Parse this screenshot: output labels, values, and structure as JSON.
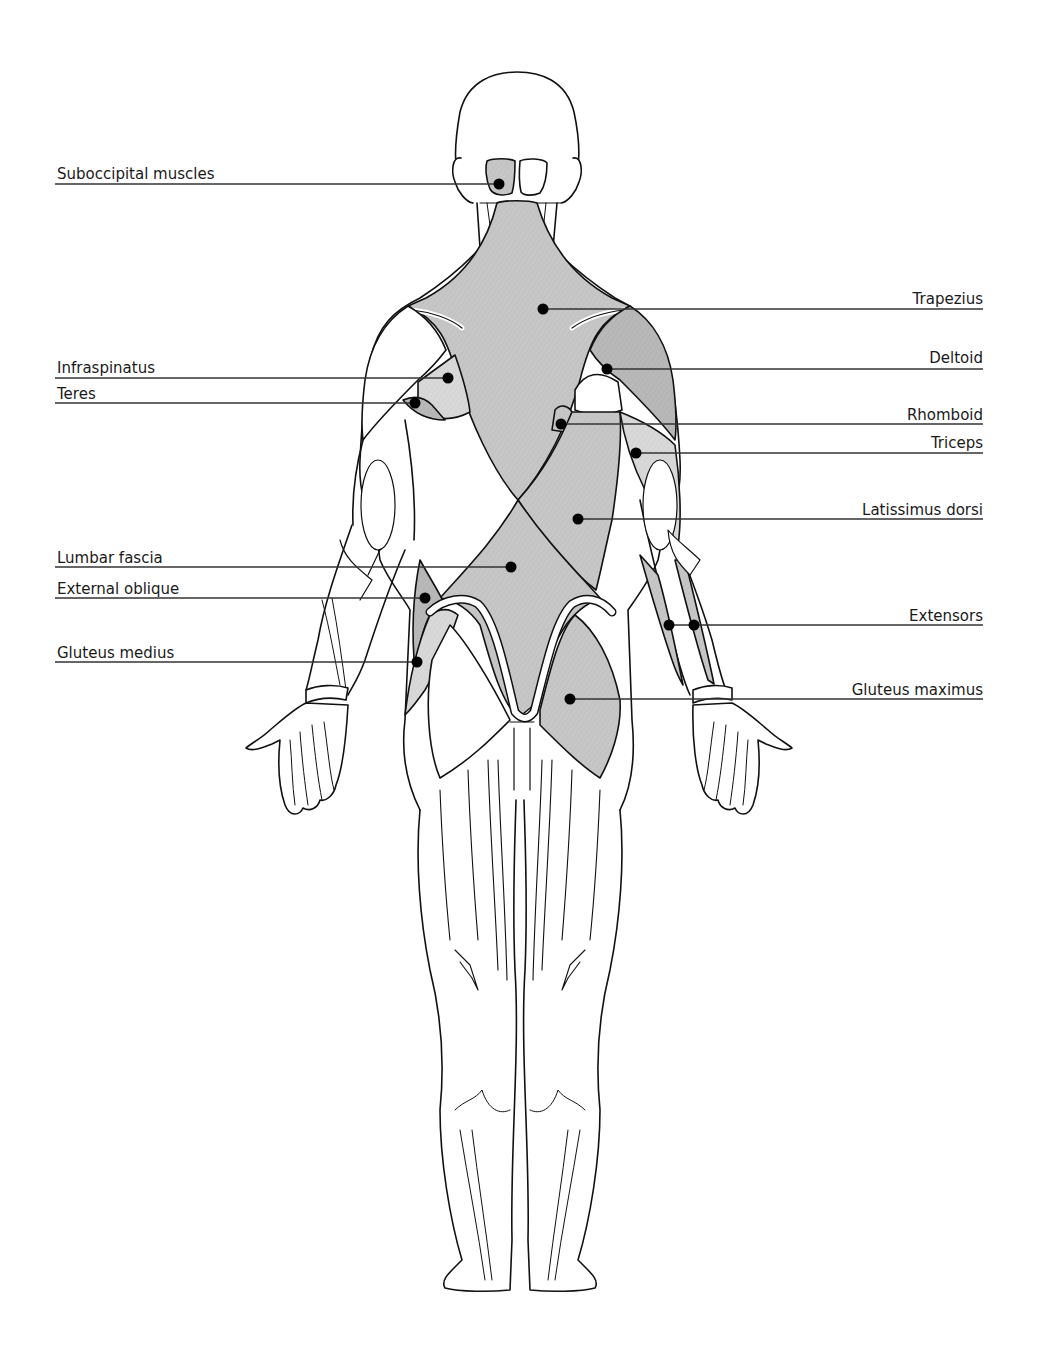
{
  "diagram": {
    "view": "posterior",
    "colors": {
      "background": "#ffffff",
      "outline": "#111111",
      "muscle_fill": "#c4c4c4",
      "muscle_fill_dark": "#b5b5b5",
      "muscle_fill_light": "#d6d6d6",
      "leader_line": "#333333",
      "marker": "#000000",
      "label_text": "#1a1a1a"
    }
  },
  "labels": {
    "left": [
      {
        "id": "suboccipital",
        "text": "Suboccipital muscles",
        "text_x": 57,
        "text_y": 167,
        "line_y": 184,
        "line_x1": 55,
        "line_x2": 499,
        "marker": [
          [
            499,
            184
          ]
        ]
      },
      {
        "id": "infraspinatus",
        "text": "Infraspinatus",
        "text_x": 57,
        "text_y": 361,
        "line_y": 378,
        "line_x1": 55,
        "line_x2": 448,
        "marker": [
          [
            448,
            378
          ]
        ]
      },
      {
        "id": "teres",
        "text": "Teres",
        "text_x": 57,
        "text_y": 387,
        "line_y": 403,
        "line_x1": 55,
        "line_x2": 415,
        "marker": [
          [
            415,
            403
          ]
        ]
      },
      {
        "id": "lumbar-fascia",
        "text": "Lumbar fascia",
        "text_x": 57,
        "text_y": 551,
        "line_y": 567,
        "line_x1": 55,
        "line_x2": 511,
        "marker": [
          [
            511,
            567
          ]
        ]
      },
      {
        "id": "external-oblique",
        "text": "External oblique",
        "text_x": 57,
        "text_y": 582,
        "line_y": 598,
        "line_x1": 55,
        "line_x2": 425,
        "marker": [
          [
            425,
            598
          ]
        ]
      },
      {
        "id": "gluteus-medius",
        "text": "Gluteus medius",
        "text_x": 57,
        "text_y": 646,
        "line_y": 662,
        "line_x1": 55,
        "line_x2": 417,
        "marker": [
          [
            417,
            662
          ]
        ]
      }
    ],
    "right": [
      {
        "id": "trapezius",
        "text": "Trapezius",
        "text_right": 983,
        "text_y": 292,
        "line_y": 309,
        "line_x1": 543,
        "line_x2": 983,
        "marker": [
          [
            543,
            309
          ]
        ]
      },
      {
        "id": "deltoid",
        "text": "Deltoid",
        "text_right": 983,
        "text_y": 351,
        "line_y": 369,
        "line_x1": 607,
        "line_x2": 983,
        "marker": [
          [
            607,
            369
          ]
        ]
      },
      {
        "id": "rhomboid",
        "text": "Rhomboid",
        "text_right": 983,
        "text_y": 408,
        "line_y": 424,
        "line_x1": 561,
        "line_x2": 983,
        "marker": [
          [
            561,
            424
          ]
        ]
      },
      {
        "id": "triceps",
        "text": "Triceps",
        "text_right": 983,
        "text_y": 436,
        "line_y": 453,
        "line_x1": 636,
        "line_x2": 983,
        "marker": [
          [
            636,
            453
          ]
        ]
      },
      {
        "id": "latissimus-dorsi",
        "text": "Latissimus dorsi",
        "text_right": 983,
        "text_y": 503,
        "line_y": 519,
        "line_x1": 578,
        "line_x2": 983,
        "marker": [
          [
            578,
            519
          ]
        ]
      },
      {
        "id": "extensors",
        "text": "Extensors",
        "text_right": 983,
        "text_y": 609,
        "line_y": 625,
        "line_x1": 669,
        "line_x2": 983,
        "marker": [
          [
            669,
            625
          ],
          [
            694,
            625
          ]
        ]
      },
      {
        "id": "gluteus-maximus",
        "text": "Gluteus maximus",
        "text_right": 983,
        "text_y": 683,
        "line_y": 699,
        "line_x1": 570,
        "line_x2": 983,
        "marker": [
          [
            570,
            699
          ]
        ]
      }
    ]
  }
}
